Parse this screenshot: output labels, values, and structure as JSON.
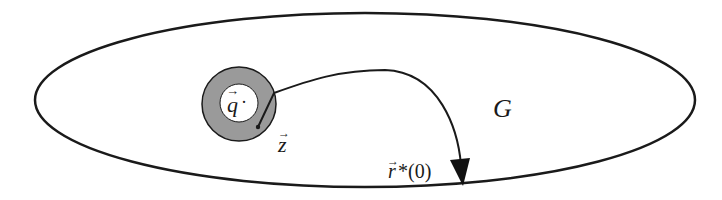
{
  "diagram": {
    "colors": {
      "stroke": "#1a1a1a",
      "ring_fill": "#9a9a9a",
      "background": "#ffffff"
    },
    "domain": {
      "shape": "ellipse",
      "label": "G"
    },
    "ring": {
      "shape": "annulus",
      "center_label": "q",
      "center_label_vector": "→",
      "center_dot": "·"
    },
    "path": {
      "start_label": "z",
      "start_label_vector": "→",
      "end_label_var": "r",
      "end_label_vector": "→",
      "end_label_suffix": "*(0)"
    }
  }
}
